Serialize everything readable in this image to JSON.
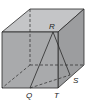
{
  "diagram": {
    "type": "cube-with-triangle",
    "labels": {
      "R": "R",
      "Q": "Q",
      "T": "T",
      "S": "S"
    },
    "colors": {
      "front_face": "#a9aaac",
      "top_face": "#c4c5c7",
      "side_face": "#9c9d9f",
      "edge": "#2a2a2a"
    }
  }
}
